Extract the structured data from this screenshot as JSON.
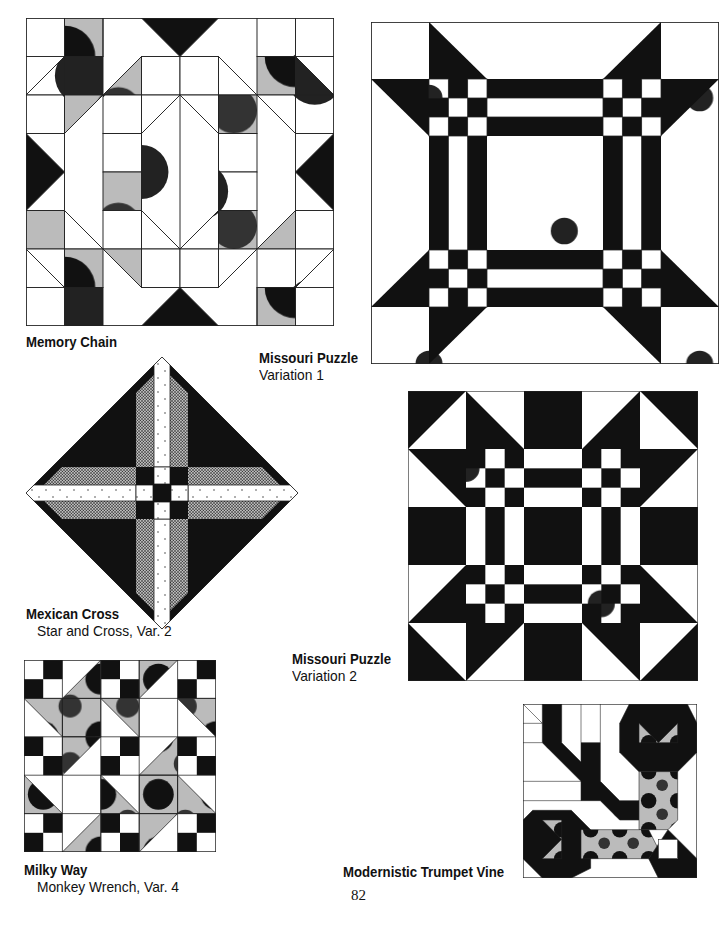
{
  "page": {
    "number": "82",
    "colors": {
      "ink": "#111111",
      "paper": "#ffffff"
    }
  },
  "blocks": [
    {
      "id": "memory-chain",
      "title": "Memory Chain",
      "subtitle": ""
    },
    {
      "id": "missouri-puzzle-1",
      "title": "Missouri Puzzle",
      "subtitle": "Variation 1"
    },
    {
      "id": "mexican-cross",
      "title": "Mexican Cross",
      "subtitle": "Star and Cross, Var. 2"
    },
    {
      "id": "missouri-puzzle-2",
      "title": "Missouri Puzzle",
      "subtitle": "Variation 2"
    },
    {
      "id": "milky-way",
      "title": "Milky Way",
      "subtitle": "Monkey Wrench, Var. 4"
    },
    {
      "id": "modernistic-trumpet-vine",
      "title": "Modernistic Trumpet Vine",
      "subtitle": ""
    }
  ]
}
